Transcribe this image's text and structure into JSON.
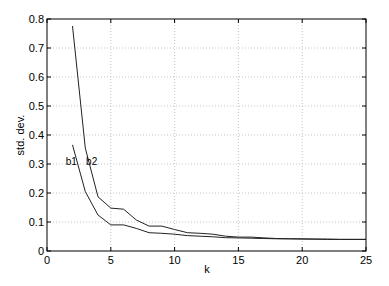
{
  "chart_data": {
    "type": "line",
    "title": "",
    "xlabel": "k",
    "ylabel": "std. dev.",
    "xlim": [
      0,
      25
    ],
    "ylim": [
      0,
      0.8
    ],
    "xticks": [
      0,
      5,
      10,
      15,
      20,
      25
    ],
    "yticks": [
      0,
      0.1,
      0.2,
      0.3,
      0.4,
      0.5,
      0.6,
      0.7,
      0.8
    ],
    "xtick_labels": [
      "0",
      "5",
      "10",
      "15",
      "20",
      "25"
    ],
    "ytick_labels": [
      "0",
      "0.1",
      "0.2",
      "0.3",
      "0.4",
      "0.5",
      "0.6",
      "0.7",
      "0.8"
    ],
    "grid": true,
    "legend": "inline labels near curve start",
    "x": [
      2,
      3,
      4,
      5,
      6,
      7,
      8,
      9,
      10,
      11,
      12,
      13,
      14,
      15,
      16,
      17,
      18,
      19,
      20,
      21,
      22,
      23,
      24,
      25
    ],
    "series": [
      {
        "name": "b1",
        "values": [
          0.366,
          0.205,
          0.124,
          0.09,
          0.09,
          0.078,
          0.063,
          0.061,
          0.058,
          0.053,
          0.051,
          0.049,
          0.046,
          0.045,
          0.044,
          0.043,
          0.042,
          0.042,
          0.041,
          0.041,
          0.04,
          0.04,
          0.04,
          0.04
        ]
      },
      {
        "name": "b2",
        "values": [
          0.776,
          0.355,
          0.187,
          0.148,
          0.144,
          0.107,
          0.086,
          0.086,
          0.074,
          0.063,
          0.061,
          0.058,
          0.051,
          0.048,
          0.048,
          0.045,
          0.043,
          0.042,
          0.042,
          0.041,
          0.041,
          0.04,
          0.04,
          0.04
        ]
      }
    ],
    "annotations": [
      {
        "text": "b1",
        "x": 1.9,
        "y": 0.31
      },
      {
        "text": "b2",
        "x": 3.5,
        "y": 0.31
      }
    ]
  }
}
